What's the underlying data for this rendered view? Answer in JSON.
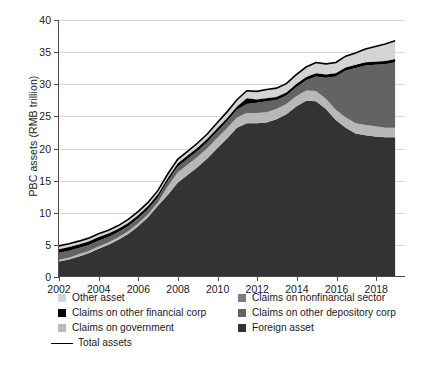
{
  "chart_data": {
    "type": "area",
    "stacked": true,
    "title": "",
    "xlabel": "",
    "ylabel": "PBC assets (RMB trillion)",
    "xlim": [
      2002,
      2019.5
    ],
    "ylim": [
      0,
      40
    ],
    "ytick_labels": [
      "0",
      "5",
      "10",
      "15",
      "20",
      "25",
      "30",
      "35",
      "40"
    ],
    "ytick_values": [
      0,
      5,
      10,
      15,
      20,
      25,
      30,
      35,
      40
    ],
    "xtick_labels": [
      "2002",
      "2004",
      "2006",
      "2008",
      "2010",
      "2012",
      "2014",
      "2016",
      "2018"
    ],
    "xtick_values": [
      2002,
      2004,
      2006,
      2008,
      2010,
      2012,
      2014,
      2016,
      2018
    ],
    "grid": true,
    "legend_position": "below",
    "x": [
      2002,
      2002.5,
      2003,
      2003.5,
      2004,
      2004.5,
      2005,
      2005.5,
      2006,
      2006.5,
      2007,
      2007.5,
      2008,
      2008.5,
      2009,
      2009.5,
      2010,
      2010.5,
      2011,
      2011.5,
      2012,
      2012.5,
      2013,
      2013.5,
      2014,
      2014.5,
      2015,
      2015.5,
      2016,
      2016.5,
      2017,
      2017.5,
      2018,
      2018.5,
      2019
    ],
    "series": [
      {
        "name": "Foreign asset",
        "color": "#333333",
        "values": [
          2.3,
          2.6,
          3.1,
          3.6,
          4.3,
          4.9,
          5.7,
          6.6,
          7.8,
          9.2,
          11.0,
          12.7,
          14.6,
          15.8,
          17.0,
          18.4,
          20.0,
          21.5,
          23.2,
          23.9,
          23.9,
          24.0,
          24.5,
          25.3,
          26.5,
          27.4,
          27.3,
          26.1,
          24.4,
          23.2,
          22.3,
          22.0,
          21.8,
          21.7,
          21.7
        ]
      },
      {
        "name": "Claims on government",
        "color": "#b8b8b8",
        "values": [
          0.28,
          0.3,
          0.32,
          0.34,
          0.36,
          0.38,
          0.4,
          0.42,
          0.44,
          0.46,
          0.5,
          1.3,
          1.6,
          1.6,
          1.6,
          1.6,
          1.6,
          1.6,
          1.6,
          1.6,
          1.6,
          1.6,
          1.6,
          1.6,
          1.6,
          1.6,
          1.6,
          1.6,
          1.6,
          1.6,
          1.6,
          1.6,
          1.6,
          1.5,
          1.5
        ]
      },
      {
        "name": "Claims on other depository corp",
        "color": "#636363",
        "values": [
          1.1,
          1.1,
          1.0,
          0.95,
          0.9,
          0.85,
          0.8,
          0.8,
          0.8,
          0.8,
          0.8,
          0.85,
          0.9,
          0.95,
          0.95,
          0.95,
          1.0,
          1.1,
          1.2,
          1.4,
          1.6,
          1.7,
          1.4,
          1.3,
          1.4,
          1.6,
          2.3,
          3.3,
          5.2,
          7.3,
          8.6,
          9.3,
          9.6,
          9.9,
          10.2
        ]
      },
      {
        "name": "Claims on other financial corp",
        "color": "#000000",
        "values": [
          0.55,
          0.55,
          0.55,
          0.55,
          0.55,
          0.55,
          0.5,
          0.5,
          0.5,
          0.5,
          0.5,
          0.5,
          0.5,
          0.5,
          0.5,
          0.5,
          0.5,
          0.5,
          0.5,
          0.9,
          0.5,
          0.5,
          0.5,
          0.5,
          0.5,
          0.5,
          0.5,
          0.5,
          0.5,
          0.5,
          0.5,
          0.5,
          0.5,
          0.5,
          0.5
        ]
      },
      {
        "name": "Claims on nonfinancial sector",
        "color": "#7d7d7d",
        "values": [
          0.06,
          0.06,
          0.06,
          0.06,
          0.06,
          0.06,
          0.06,
          0.06,
          0.06,
          0.06,
          0.06,
          0.06,
          0.06,
          0.06,
          0.06,
          0.06,
          0.06,
          0.06,
          0.06,
          0.06,
          0.06,
          0.06,
          0.06,
          0.06,
          0.06,
          0.06,
          0.06,
          0.06,
          0.06,
          0.06,
          0.06,
          0.06,
          0.06,
          0.06,
          0.06
        ]
      },
      {
        "name": "Other asset",
        "color": "#d4d4d4",
        "values": [
          0.45,
          0.45,
          0.45,
          0.45,
          0.45,
          0.45,
          0.45,
          0.5,
          0.5,
          0.5,
          0.5,
          0.55,
          0.6,
          0.6,
          0.65,
          0.7,
          0.8,
          0.9,
          1.0,
          1.1,
          1.2,
          1.3,
          1.3,
          1.3,
          1.4,
          1.5,
          1.6,
          1.6,
          1.6,
          1.7,
          1.8,
          2.0,
          2.3,
          2.6,
          2.8
        ]
      }
    ],
    "total_line": {
      "name": "Total assets",
      "color": "#000000",
      "values": [
        4.74,
        5.06,
        5.48,
        5.95,
        6.62,
        7.18,
        7.91,
        8.88,
        10.1,
        11.52,
        13.36,
        15.96,
        18.26,
        19.51,
        20.76,
        22.21,
        23.96,
        25.66,
        27.56,
        28.96,
        28.86,
        29.16,
        29.36,
        30.06,
        31.46,
        32.66,
        33.36,
        33.16,
        33.36,
        34.36,
        34.86,
        35.46,
        35.86,
        36.26,
        36.76
      ]
    }
  },
  "legend": {
    "rows": [
      [
        {
          "label": "Other asset",
          "color": "#d4d4d4",
          "type": "swatch"
        },
        {
          "label": "Claims on nonfinancial sector",
          "color": "#7d7d7d",
          "type": "swatch"
        }
      ],
      [
        {
          "label": "Claims on other financial corp",
          "color": "#000000",
          "type": "swatch"
        },
        {
          "label": "Claims on other depository corp",
          "color": "#636363",
          "type": "swatch"
        }
      ],
      [
        {
          "label": "Claims on government",
          "color": "#b8b8b8",
          "type": "swatch"
        },
        {
          "label": "Foreign asset",
          "color": "#333333",
          "type": "swatch"
        }
      ],
      [
        {
          "label": "Total assets",
          "color": "#000000",
          "type": "line"
        }
      ]
    ]
  }
}
